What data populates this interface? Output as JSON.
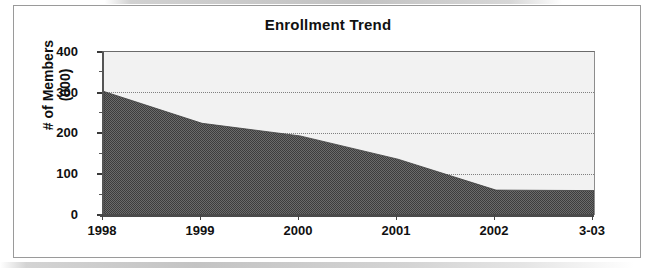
{
  "chart_data": {
    "type": "area",
    "title": "Enrollment Trend",
    "xlabel": "",
    "ylabel": "# of Members (000)",
    "ylabel_line1": "# of Members",
    "ylabel_line2": "(000)",
    "categories": [
      "1998",
      "1999",
      "2000",
      "2001",
      "2002",
      "3-03"
    ],
    "values": [
      303,
      225,
      194,
      137,
      61,
      60
    ],
    "ylim": [
      0,
      400
    ],
    "yticks": [
      0,
      100,
      200,
      300,
      400
    ],
    "ytick_labels": [
      "0",
      "100",
      "200",
      "300",
      "400"
    ],
    "grid": true,
    "grid_style": "dotted-horizontal",
    "legend": "none",
    "series": [
      {
        "name": "# of Members (000)",
        "values": [
          303,
          225,
          194,
          137,
          61,
          60
        ],
        "fill_color": "#595959",
        "fill_pattern": "dither-gray"
      }
    ],
    "plot_background": "#f2f2f2",
    "axis_color": "#3a3a3a",
    "border_color": "#9a9a9a"
  }
}
